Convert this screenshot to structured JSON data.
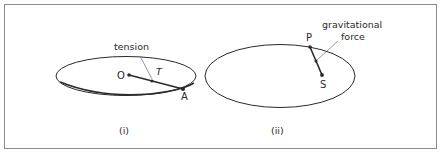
{
  "figure": {
    "panels": [
      {
        "id": "i",
        "caption": "(i)",
        "points": {
          "center": "O",
          "edge": "A"
        },
        "force_symbol": "T",
        "annotation": "tension"
      },
      {
        "id": "ii",
        "caption": "(ii)",
        "points": {
          "start": "P",
          "end": "S"
        },
        "annotation_line1": "gravitational",
        "annotation_line2": "force"
      }
    ]
  },
  "colors": {
    "line": "#2a2a2a",
    "frame": "#888888",
    "background": "#ffffff"
  }
}
